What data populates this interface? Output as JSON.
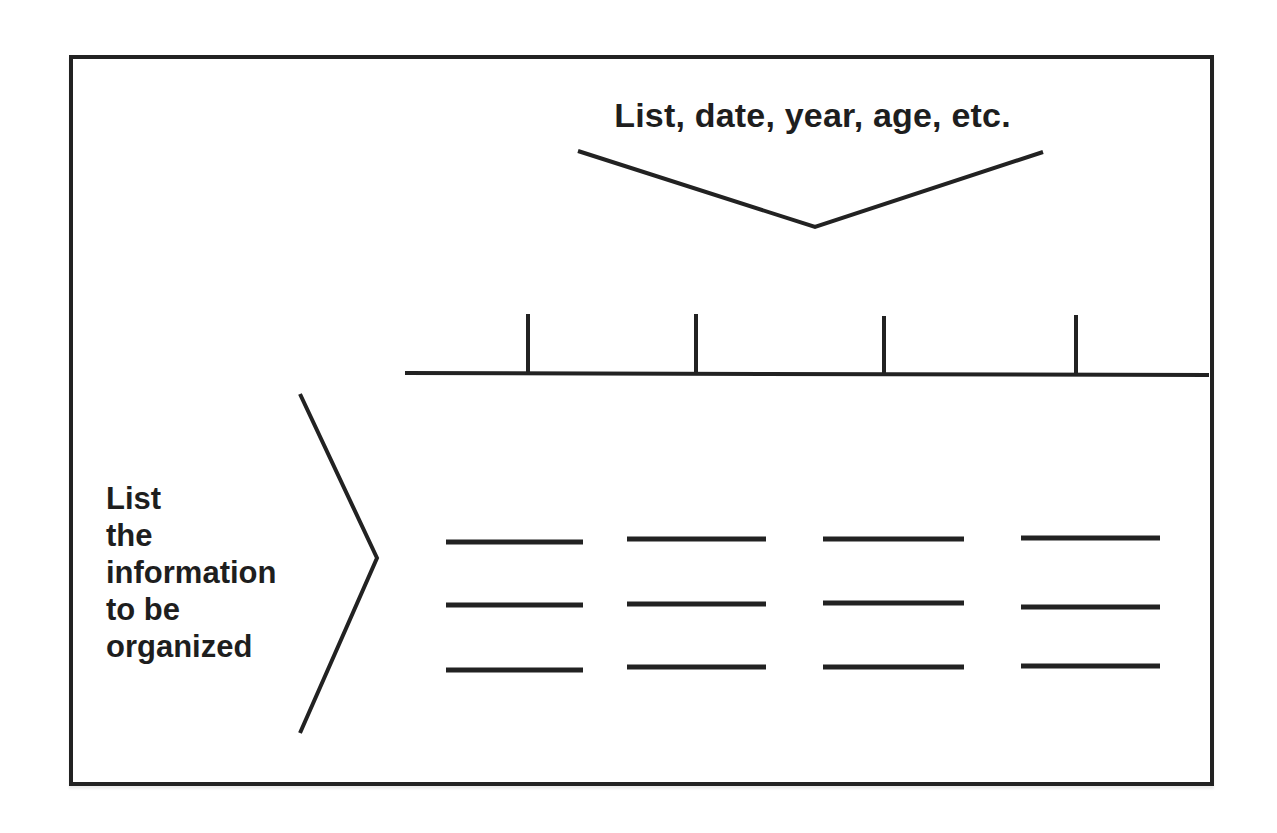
{
  "diagram": {
    "type": "graphic-organizer",
    "top_label": "List, date, year, age, etc.",
    "side_label_lines": [
      "List",
      "the",
      "information",
      "to be",
      "organized"
    ],
    "timeline": {
      "tick_count": 4,
      "tick_x": [
        528,
        696,
        884,
        1076
      ]
    },
    "entry_columns": 4,
    "entry_rows": 3,
    "colors": {
      "stroke": "#222222",
      "text": "#1e1e1e",
      "background": "#ffffff"
    }
  }
}
